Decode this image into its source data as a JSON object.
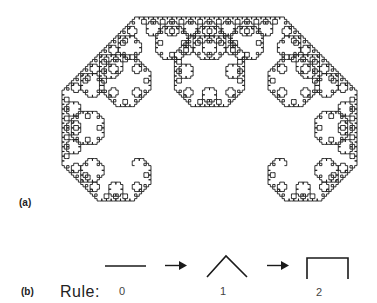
{
  "figure": {
    "panel_a": {
      "label": "(a)",
      "fractal": "Lévy C curve",
      "iterations": 12,
      "stroke_color": "#1a1a1a"
    },
    "panel_b": {
      "label": "(b)",
      "rule_word": "Rule:",
      "steps": [
        {
          "label": "0",
          "shape": "straight-segment"
        },
        {
          "label": "1",
          "shape": "caret-two-segments-at-45-degrees"
        },
        {
          "label": "2",
          "shape": "three-segment-bracket"
        }
      ],
      "arrow_icon": "right-arrow-icon"
    }
  }
}
